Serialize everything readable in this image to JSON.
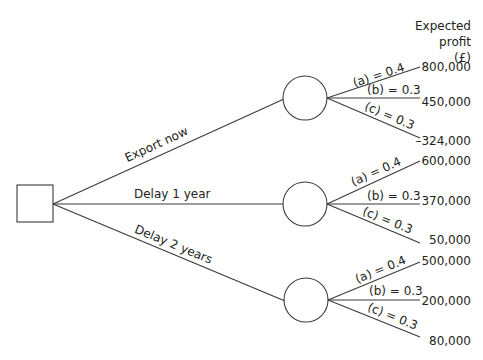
{
  "header": {
    "line1": "Expected profit",
    "line2": "(£)"
  },
  "decision_node": {
    "type": "decision",
    "shape": "square"
  },
  "options": [
    {
      "label": "Export now",
      "outcomes": [
        {
          "prob_label": "(a) = 0.4",
          "value": "800,000"
        },
        {
          "prob_label": "(b) = 0.3",
          "value": "450,000"
        },
        {
          "prob_label": "(c) = 0.3",
          "value": "–324,000"
        }
      ]
    },
    {
      "label": "Delay 1 year",
      "outcomes": [
        {
          "prob_label": "(a) = 0.4",
          "value": "600,000"
        },
        {
          "prob_label": "(b) = 0.3",
          "value": "370,000"
        },
        {
          "prob_label": "(c) = 0.3",
          "value": "50,000"
        }
      ]
    },
    {
      "label": "Delay 2 years",
      "outcomes": [
        {
          "prob_label": "(a) = 0.4",
          "value": "500,000"
        },
        {
          "prob_label": "(b) = 0.3",
          "value": "200,000"
        },
        {
          "prob_label": "(c) = 0.3",
          "value": "80,000"
        }
      ]
    }
  ],
  "colors": {
    "line": "#3a3a3a",
    "text": "#231f20",
    "background": "#ffffff"
  }
}
